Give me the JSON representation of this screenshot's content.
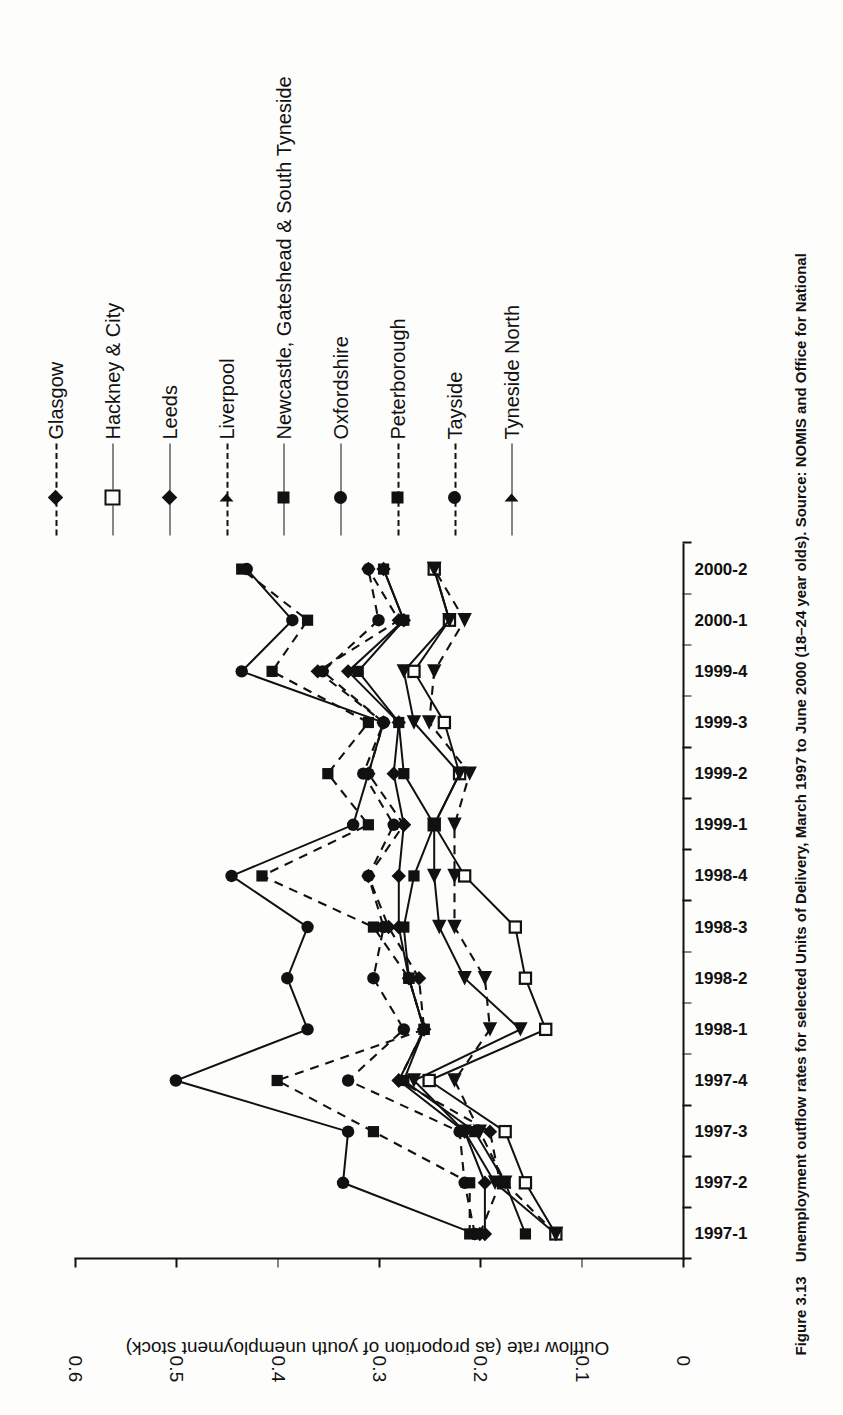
{
  "figure": {
    "number": "Figure 3.13",
    "caption": "Unemployment outflow rates for selected Units of Delivery, March 1997 to June 2000 (18–24 year olds). Source: NOMIS and Office for National"
  },
  "axes": {
    "y_title": "Outflow rate (as proportion of youth unemployment stock)",
    "y_ticks": [
      "0",
      "0.1",
      "0.2",
      "0.3",
      "0.4",
      "0.5",
      "0.6"
    ],
    "x_ticks": [
      "1997-1",
      "1997-2",
      "1997-3",
      "1997-4",
      "1998-1",
      "1998-2",
      "1998-3",
      "1998-4",
      "1999-1",
      "1999-2",
      "1999-3",
      "1999-4",
      "2000-1",
      "2000-2"
    ]
  },
  "legend": {
    "position": "right",
    "items": [
      {
        "label": "Glasgow",
        "marker": "diamond",
        "line": "dashed"
      },
      {
        "label": "Hackney & City",
        "marker": "square-open",
        "line": "solid"
      },
      {
        "label": "Leeds",
        "marker": "diamond",
        "line": "solid"
      },
      {
        "label": "Liverpool",
        "marker": "triangle",
        "line": "dashed"
      },
      {
        "label": "Newcastle, Gateshead & South Tyneside",
        "marker": "square",
        "line": "solid"
      },
      {
        "label": "Oxfordshire",
        "marker": "circle",
        "line": "solid"
      },
      {
        "label": "Peterborough",
        "marker": "square",
        "line": "dashed"
      },
      {
        "label": "Tayside",
        "marker": "circle",
        "line": "dashed"
      },
      {
        "label": "Tyneside North",
        "marker": "triangle",
        "line": "solid"
      }
    ]
  },
  "chart_data": {
    "type": "line",
    "title": "",
    "xlabel": "",
    "ylabel": "Outflow rate (as proportion of youth unemployment stock)",
    "ylim": [
      0,
      0.6
    ],
    "ytick_values": [
      0,
      0.1,
      0.2,
      0.3,
      0.4,
      0.5,
      0.6
    ],
    "grid": false,
    "legend_position": "right",
    "categories": [
      "1997-1",
      "1997-2",
      "1997-3",
      "1997-4",
      "1998-1",
      "1998-2",
      "1998-3",
      "1998-4",
      "1999-1",
      "1999-2",
      "1999-3",
      "1999-4",
      "2000-1",
      "2000-2"
    ],
    "series": [
      {
        "name": "Glasgow",
        "marker": "diamond",
        "line": "dashed",
        "values": [
          0.2,
          0.18,
          0.19,
          0.28,
          0.255,
          0.26,
          0.29,
          0.31,
          0.275,
          0.31,
          0.295,
          0.36,
          0.28,
          0.31
        ]
      },
      {
        "name": "Hackney & City",
        "marker": "square-open",
        "line": "solid",
        "values": [
          0.125,
          0.155,
          0.175,
          0.25,
          0.135,
          0.155,
          0.165,
          0.215,
          0.245,
          0.22,
          0.235,
          0.265,
          0.23,
          0.245
        ]
      },
      {
        "name": "Leeds",
        "marker": "diamond",
        "line": "solid",
        "values": [
          0.195,
          0.195,
          0.215,
          0.28,
          0.255,
          0.27,
          0.28,
          0.28,
          0.275,
          0.285,
          0.28,
          0.33,
          0.275,
          0.295
        ]
      },
      {
        "name": "Liverpool",
        "marker": "triangle",
        "line": "dashed",
        "values": [
          0.125,
          0.175,
          0.2,
          0.225,
          0.19,
          0.195,
          0.225,
          0.225,
          0.225,
          0.21,
          0.25,
          0.245,
          0.215,
          0.245
        ]
      },
      {
        "name": "Newcastle, Gateshead & South Tyneside",
        "marker": "square",
        "line": "solid",
        "values": [
          0.155,
          0.175,
          0.205,
          0.275,
          0.255,
          0.27,
          0.275,
          0.265,
          0.245,
          0.275,
          0.28,
          0.32,
          0.275,
          0.295
        ]
      },
      {
        "name": "Oxfordshire",
        "marker": "circle",
        "line": "solid",
        "values": [
          0.205,
          0.335,
          0.33,
          0.5,
          0.37,
          0.39,
          0.37,
          0.445,
          0.325,
          0.31,
          0.295,
          0.435,
          0.385,
          0.43
        ]
      },
      {
        "name": "Peterborough",
        "marker": "square",
        "line": "dashed",
        "values": [
          0.21,
          0.21,
          0.305,
          0.4,
          0.255,
          0.27,
          0.305,
          0.415,
          0.31,
          0.35,
          0.31,
          0.405,
          0.37,
          0.435
        ]
      },
      {
        "name": "Tayside",
        "marker": "circle",
        "line": "dashed",
        "values": [
          0.205,
          0.215,
          0.22,
          0.33,
          0.275,
          0.305,
          0.295,
          0.31,
          0.285,
          0.315,
          0.295,
          0.355,
          0.3,
          0.31
        ]
      },
      {
        "name": "Tyneside North",
        "marker": "triangle",
        "line": "solid",
        "values": [
          0.125,
          0.185,
          0.215,
          0.265,
          0.16,
          0.215,
          0.24,
          0.245,
          0.245,
          0.22,
          0.265,
          0.275,
          0.23,
          0.245
        ]
      }
    ]
  }
}
